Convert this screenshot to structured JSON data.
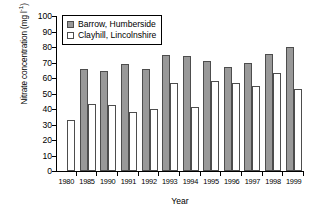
{
  "chart_data": {
    "type": "bar",
    "title": "",
    "xlabel": "Year",
    "ylabel": "Nitrate concentration (mg l⁻¹)",
    "ylabel_main": "Nitrate concentration (mg l",
    "ylabel_sup": "-1",
    "ylabel_tail": ")",
    "categories": [
      "1980",
      "1985",
      "1990",
      "1991",
      "1992",
      "1993",
      "1994",
      "1995",
      "1996",
      "1997",
      "1998",
      "1999"
    ],
    "series": [
      {
        "name": "Barrow, Humberside",
        "color": "#999999",
        "values": [
          null,
          66,
          64.5,
          69,
          66,
          75,
          74.5,
          71,
          67,
          70,
          75.5,
          80
        ]
      },
      {
        "name": "Clayhill, Lincolnshire",
        "color": "#ffffff",
        "values": [
          33,
          43,
          42.5,
          38,
          40,
          57,
          41,
          58,
          56.5,
          55,
          63.5,
          53
        ]
      }
    ],
    "ylim": [
      0,
      100
    ],
    "ytick_values": [
      0,
      10,
      20,
      30,
      40,
      50,
      60,
      70,
      80,
      90,
      100
    ],
    "ytick_labels": [
      "0",
      "10",
      "20",
      "30",
      "40",
      "50",
      "60",
      "70",
      "80",
      "90",
      "100"
    ],
    "grid": false,
    "legend_position": "upper-left-inside",
    "bar_border_color": "#4d4d4d",
    "axis_color": "#000000"
  }
}
